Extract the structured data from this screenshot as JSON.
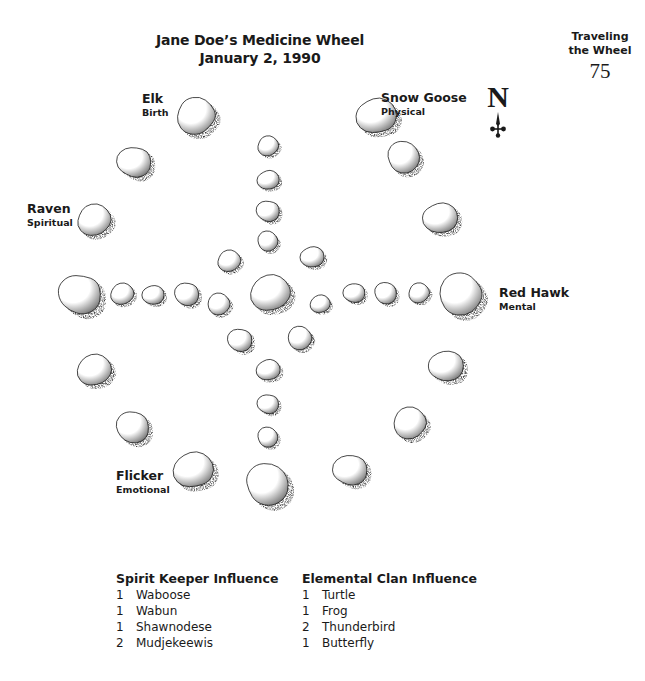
{
  "header": {
    "running_title_line1": "Traveling",
    "running_title_line2": "the Wheel",
    "page_number": "75"
  },
  "figure": {
    "title_line1": "Jane Doe’s Medicine Wheel",
    "title_line2": "January 2, 1990",
    "compass": {
      "letter": "N",
      "icon": "north-arrow-icon"
    },
    "positions": [
      {
        "id": "elk",
        "name": "Elk",
        "aspect": "Birth"
      },
      {
        "id": "snow-goose",
        "name": "Snow Goose",
        "aspect": "Physical"
      },
      {
        "id": "raven",
        "name": "Raven",
        "aspect": "Spiritual"
      },
      {
        "id": "red-hawk",
        "name": "Red Hawk",
        "aspect": "Mental"
      },
      {
        "id": "flicker",
        "name": "Flicker",
        "aspect": "Emotional"
      }
    ],
    "stones": [
      {
        "cx": 196,
        "cy": 116,
        "r": 22,
        "role": "outer"
      },
      {
        "cx": 376,
        "cy": 116,
        "r": 22,
        "role": "outer"
      },
      {
        "cx": 134,
        "cy": 162,
        "r": 19,
        "role": "outer"
      },
      {
        "cx": 404,
        "cy": 157,
        "r": 19,
        "role": "outer"
      },
      {
        "cx": 94,
        "cy": 220,
        "r": 19,
        "role": "outer"
      },
      {
        "cx": 440,
        "cy": 218,
        "r": 19,
        "role": "outer"
      },
      {
        "cx": 80,
        "cy": 294,
        "r": 24,
        "role": "outer-west"
      },
      {
        "cx": 461,
        "cy": 294,
        "r": 25,
        "role": "outer-east"
      },
      {
        "cx": 94,
        "cy": 370,
        "r": 19,
        "role": "outer"
      },
      {
        "cx": 446,
        "cy": 366,
        "r": 19,
        "role": "outer"
      },
      {
        "cx": 133,
        "cy": 427,
        "r": 19,
        "role": "outer"
      },
      {
        "cx": 410,
        "cy": 423,
        "r": 19,
        "role": "outer"
      },
      {
        "cx": 193,
        "cy": 470,
        "r": 22,
        "role": "outer"
      },
      {
        "cx": 350,
        "cy": 470,
        "r": 19,
        "role": "outer"
      },
      {
        "cx": 268,
        "cy": 484,
        "r": 25,
        "role": "outer-south"
      },
      {
        "cx": 268,
        "cy": 146,
        "r": 12,
        "role": "spoke-north"
      },
      {
        "cx": 268,
        "cy": 180,
        "r": 12,
        "role": "spoke-north"
      },
      {
        "cx": 268,
        "cy": 211,
        "r": 13,
        "role": "spoke-north"
      },
      {
        "cx": 268,
        "cy": 241,
        "r": 12,
        "role": "spoke-north"
      },
      {
        "cx": 122,
        "cy": 294,
        "r": 13,
        "role": "spoke-west"
      },
      {
        "cx": 153,
        "cy": 295,
        "r": 12,
        "role": "spoke-west"
      },
      {
        "cx": 187,
        "cy": 294,
        "r": 14,
        "role": "spoke-west"
      },
      {
        "cx": 219,
        "cy": 304,
        "r": 13,
        "role": "spoke-west"
      },
      {
        "cx": 320,
        "cy": 304,
        "r": 11,
        "role": "spoke-east"
      },
      {
        "cx": 354,
        "cy": 293,
        "r": 12,
        "role": "spoke-east"
      },
      {
        "cx": 386,
        "cy": 293,
        "r": 13,
        "role": "spoke-east"
      },
      {
        "cx": 419,
        "cy": 293,
        "r": 12,
        "role": "spoke-east"
      },
      {
        "cx": 268,
        "cy": 370,
        "r": 13,
        "role": "spoke-south"
      },
      {
        "cx": 268,
        "cy": 404,
        "r": 12,
        "role": "spoke-south"
      },
      {
        "cx": 268,
        "cy": 437,
        "r": 12,
        "role": "spoke-south"
      },
      {
        "cx": 229,
        "cy": 261,
        "r": 13,
        "role": "inner-ring"
      },
      {
        "cx": 312,
        "cy": 257,
        "r": 13,
        "role": "inner-ring"
      },
      {
        "cx": 240,
        "cy": 340,
        "r": 14,
        "role": "inner-ring"
      },
      {
        "cx": 300,
        "cy": 338,
        "r": 14,
        "role": "inner-ring"
      },
      {
        "cx": 270,
        "cy": 293,
        "r": 22,
        "role": "center"
      }
    ]
  },
  "influences": {
    "spirit_keeper": {
      "title": "Spirit Keeper Influence",
      "items": [
        {
          "count": "1",
          "name": "Waboose"
        },
        {
          "count": "1",
          "name": "Wabun"
        },
        {
          "count": "1",
          "name": "Shawnodese"
        },
        {
          "count": "2",
          "name": "Mudjekeewis"
        }
      ]
    },
    "elemental_clan": {
      "title": "Elemental Clan Influence",
      "items": [
        {
          "count": "1",
          "name": "Turtle"
        },
        {
          "count": "1",
          "name": "Frog"
        },
        {
          "count": "2",
          "name": "Thunderbird"
        },
        {
          "count": "1",
          "name": "Butterfly"
        }
      ]
    }
  },
  "colors": {
    "ink": "#1a1a1a",
    "stone_fill": "#ffffff",
    "stone_shade": "#3a3a3a",
    "paper": "#ffffff"
  }
}
